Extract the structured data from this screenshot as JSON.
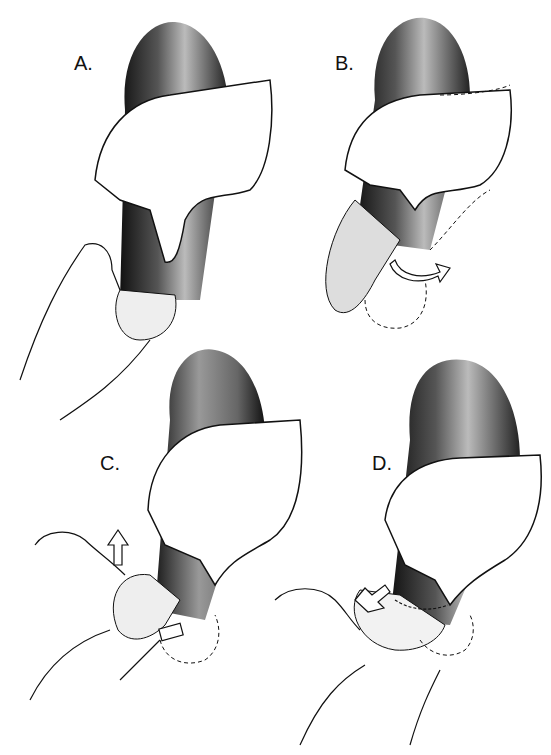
{
  "figure": {
    "panels": [
      {
        "id": "A",
        "label": "A.",
        "description": "Infant leg held by adult hand at ankle; second hand grips foot from below"
      },
      {
        "id": "B",
        "label": "B.",
        "description": "Foot rotated with curved arrow indicating rotation; dashed outline of prior foot position"
      },
      {
        "id": "C",
        "label": "C.",
        "description": "Foot pushed upward with upward arrow; small block/pad under heel; dashed outline"
      },
      {
        "id": "D",
        "label": "D.",
        "description": "Foot corrected with diagonal arrow; band wrapped around ankle"
      }
    ],
    "arrows": [
      {
        "panel": "B",
        "type": "curved-rotation-arrow"
      },
      {
        "panel": "C",
        "type": "up-arrow"
      },
      {
        "panel": "D",
        "type": "diagonal-arrow"
      }
    ],
    "colors": {
      "ink": "#111111",
      "shade": "#2a2a2a",
      "background": "#ffffff"
    }
  }
}
